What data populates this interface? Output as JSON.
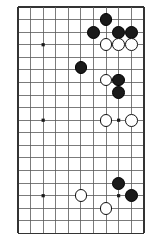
{
  "diagram": {
    "kind": "go-board-diagram",
    "board": {
      "columns": 11,
      "rows": 19,
      "origin_x": 18.0,
      "origin_y": 7.0,
      "cell": 12.58,
      "line_color": "#5a5a5a",
      "edge_color": "#333333",
      "background_color": "#ffffff",
      "line_width": 0.8,
      "edge_width": 1.5,
      "stone_radius": 6.4
    },
    "star_points": [
      {
        "col": 2,
        "row": 3
      },
      {
        "col": 2,
        "row": 9
      },
      {
        "col": 8,
        "row": 9
      },
      {
        "col": 2,
        "row": 15
      },
      {
        "col": 8,
        "row": 15
      }
    ],
    "stones": [
      {
        "color": "black",
        "col": 7,
        "row": 1
      },
      {
        "color": "black",
        "col": 6,
        "row": 2
      },
      {
        "color": "black",
        "col": 8,
        "row": 2
      },
      {
        "color": "black",
        "col": 9,
        "row": 2
      },
      {
        "color": "white",
        "col": 7,
        "row": 3
      },
      {
        "color": "white",
        "col": 8,
        "row": 3
      },
      {
        "color": "white",
        "col": 9,
        "row": 3
      },
      {
        "color": "black",
        "col": 5,
        "row": 4.8
      },
      {
        "color": "white",
        "col": 7,
        "row": 5.8
      },
      {
        "color": "black",
        "col": 8,
        "row": 5.8
      },
      {
        "color": "black",
        "col": 8,
        "row": 6.8
      },
      {
        "color": "white",
        "col": 7,
        "row": 9
      },
      {
        "color": "white",
        "col": 9,
        "row": 9
      },
      {
        "color": "black",
        "col": 8,
        "row": 14
      },
      {
        "color": "black",
        "col": 9,
        "row": 15
      },
      {
        "color": "white",
        "col": 5,
        "row": 15
      },
      {
        "color": "white",
        "col": 7,
        "row": 16
      }
    ],
    "colors": {
      "black_stone": "#1a1a1a",
      "white_stone": "#ffffff",
      "stone_outline": "#111111",
      "grid": "#5a5a5a"
    }
  }
}
